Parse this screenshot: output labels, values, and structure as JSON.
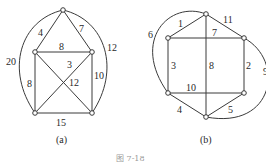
{
  "figure": {
    "caption": "图   7-18",
    "graphs": [
      {
        "id": "a",
        "sublabel": "(a)",
        "nodes": [
          "top",
          "upper-left",
          "upper-right",
          "lower-left",
          "lower-right"
        ],
        "edges": [
          {
            "from": "top",
            "to": "upper-left",
            "weight": "4"
          },
          {
            "from": "top",
            "to": "upper-right",
            "weight": "7"
          },
          {
            "from": "upper-left",
            "to": "upper-right",
            "weight": "8"
          },
          {
            "from": "upper-left",
            "to": "lower-left",
            "weight": "8"
          },
          {
            "from": "upper-right",
            "to": "lower-right",
            "weight": "10"
          },
          {
            "from": "lower-left",
            "to": "lower-right",
            "weight": "15"
          },
          {
            "from": "upper-right",
            "to": "lower-left",
            "weight": "3"
          },
          {
            "from": "upper-left",
            "to": "lower-right",
            "weight": "12"
          },
          {
            "from": "top",
            "to": "lower-left",
            "weight": "20",
            "curved": true
          },
          {
            "from": "top",
            "to": "lower-right",
            "weight": "12",
            "curved": true
          }
        ]
      },
      {
        "id": "b",
        "sublabel": "(b)",
        "nodes": [
          "top",
          "upper-left",
          "upper-right",
          "lower-left",
          "lower-right",
          "bottom"
        ],
        "edges": [
          {
            "from": "top",
            "to": "upper-left",
            "weight": "1"
          },
          {
            "from": "top",
            "to": "upper-right",
            "weight": "11"
          },
          {
            "from": "upper-left",
            "to": "upper-right",
            "weight": "7"
          },
          {
            "from": "upper-left",
            "to": "lower-left",
            "weight": "3"
          },
          {
            "from": "upper-right",
            "to": "lower-right",
            "weight": "2"
          },
          {
            "from": "top",
            "to": "bottom",
            "weight": "8"
          },
          {
            "from": "lower-left",
            "to": "lower-right",
            "weight": "10"
          },
          {
            "from": "lower-left",
            "to": "bottom",
            "weight": "4"
          },
          {
            "from": "lower-right",
            "to": "bottom",
            "weight": "5"
          },
          {
            "from": "top",
            "to": "lower-left",
            "weight": "6",
            "curved": true
          },
          {
            "from": "upper-right",
            "to": "bottom",
            "weight": "9",
            "curved": true
          }
        ]
      }
    ]
  }
}
